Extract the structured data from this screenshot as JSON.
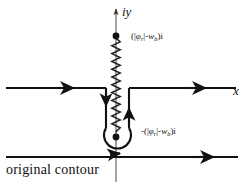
{
  "figure": {
    "caption": "original contour",
    "axis_y_label": "iy",
    "axis_x_label": "x",
    "upper_branch_point_label": "(|φr|-wb)i",
    "lower_branch_point_label": "-(|φr|-wb)i",
    "upper_label_parts": {
      "open": "(|",
      "phi": "φ",
      "phi_sub": "r",
      "bar_minus": "|-",
      "w": "w",
      "w_sub": "b",
      "close": ")i"
    },
    "lower_label_parts": {
      "lead": "-(|",
      "phi": "φ",
      "phi_sub": "r",
      "bar_minus": "|-",
      "w": "w",
      "w_sub": "b",
      "close": ")i"
    },
    "colors": {
      "ink": "#111111",
      "axis": "#4a4a4a",
      "background": "#ffffff"
    },
    "elements": {
      "branch_cut_name": "branch cut (wavy vertical line)",
      "upper_branch_point": "filled dot on positive imaginary axis",
      "lower_branch_point": "filled dot on negative imaginary axis",
      "deformed_contour": "contour deformed around lower branch point",
      "original_contour": "straight horizontal contour below"
    }
  }
}
